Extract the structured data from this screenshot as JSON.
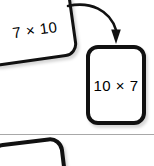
{
  "canvas": {
    "background_color": "#ffffff",
    "width": 154,
    "height": 166
  },
  "theme": {
    "card_outline_color": "#111111",
    "card_fill_color": "#ffffff",
    "text_color": "#000000",
    "arrow_color": "#111111",
    "divider_color": "#a8a8a8"
  },
  "cards": {
    "source": {
      "label": "7 × 10",
      "multiplicand": 7,
      "multiplier": 10
    },
    "target": {
      "label": "10 × 7",
      "multiplicand": 10,
      "multiplier": 7
    },
    "next": {
      "label": ""
    }
  },
  "arrow": {
    "name": "curved-arrow",
    "direction": "source-to-target"
  }
}
